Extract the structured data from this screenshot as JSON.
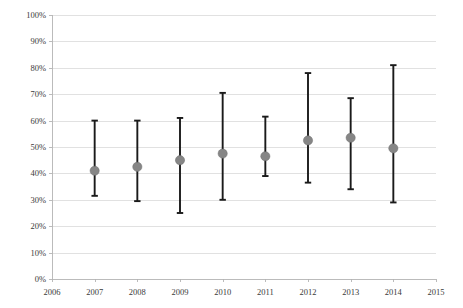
{
  "chart_data": {
    "type": "scatter",
    "title": "",
    "subtitle": "",
    "xlabel": "",
    "ylabel": "",
    "grid": true,
    "legend": null,
    "xlim": [
      2006,
      2015
    ],
    "ylim": [
      0,
      100
    ],
    "x_tick_labels": [
      "2006",
      "2007",
      "2008",
      "2009",
      "2010",
      "2011",
      "2012",
      "2013",
      "2014",
      "2015"
    ],
    "y_tick_labels": [
      "0%",
      "10%",
      "20%",
      "30%",
      "40%",
      "50%",
      "60%",
      "70%",
      "80%",
      "90%",
      "100%"
    ],
    "y_tick_values": [
      0,
      10,
      20,
      30,
      40,
      50,
      60,
      70,
      80,
      90,
      100
    ],
    "series": [
      {
        "name": "estimate",
        "x": [
          2007,
          2008,
          2009,
          2010,
          2011,
          2012,
          2013,
          2014
        ],
        "values": [
          41,
          42.5,
          45,
          47.5,
          46.5,
          52.5,
          53.5,
          49.5
        ],
        "lower": [
          31.5,
          29.5,
          25,
          30,
          39,
          36.5,
          34,
          29
        ],
        "upper": [
          60,
          60,
          61,
          70.5,
          61.5,
          78,
          68.5,
          81
        ],
        "marker_color": "#868686",
        "error_color": "#1a1a1a"
      }
    ]
  },
  "colors": {
    "background": "#ffffff",
    "gridline": "#d9d9d9",
    "axis": "#b4b4b4",
    "marker": "#868686",
    "error_bar": "#1a1a1a",
    "tick_text": "#3a3a3a"
  }
}
